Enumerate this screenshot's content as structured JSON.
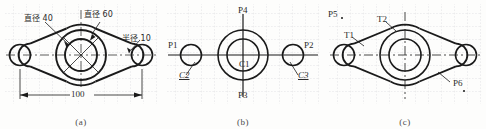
{
  "figure": {
    "panels": [
      {
        "id": "a",
        "caption": "(a)",
        "labels": [
          {
            "name": "diameter-40",
            "text": "直径 40"
          },
          {
            "name": "diameter-60",
            "text": "直径 60"
          },
          {
            "name": "radius-10",
            "text": "半径 10"
          }
        ],
        "dimensions": [
          {
            "name": "overall-width",
            "value": "100"
          }
        ]
      },
      {
        "id": "b",
        "caption": "(b)",
        "labels": [
          {
            "name": "point-p1",
            "text": "P1"
          },
          {
            "name": "point-p2",
            "text": "P2"
          },
          {
            "name": "point-p3",
            "text": "P3"
          },
          {
            "name": "point-p4",
            "text": "P4"
          },
          {
            "name": "circle-c1",
            "text": "C1"
          },
          {
            "name": "circle-c2",
            "text": "C2"
          },
          {
            "name": "circle-c3",
            "text": "C3"
          }
        ]
      },
      {
        "id": "c",
        "caption": "(c)",
        "labels": [
          {
            "name": "point-p5",
            "text": "P5"
          },
          {
            "name": "point-p6",
            "text": "P6"
          },
          {
            "name": "tangent-t1",
            "text": "T1"
          },
          {
            "name": "tangent-t2",
            "text": "T2"
          }
        ]
      }
    ]
  },
  "style": {
    "grid_color": "#c9c9cf",
    "outline_color": "#1a1a1a",
    "center_line_color": "#333333",
    "paper_color": "#fdfdfc"
  }
}
